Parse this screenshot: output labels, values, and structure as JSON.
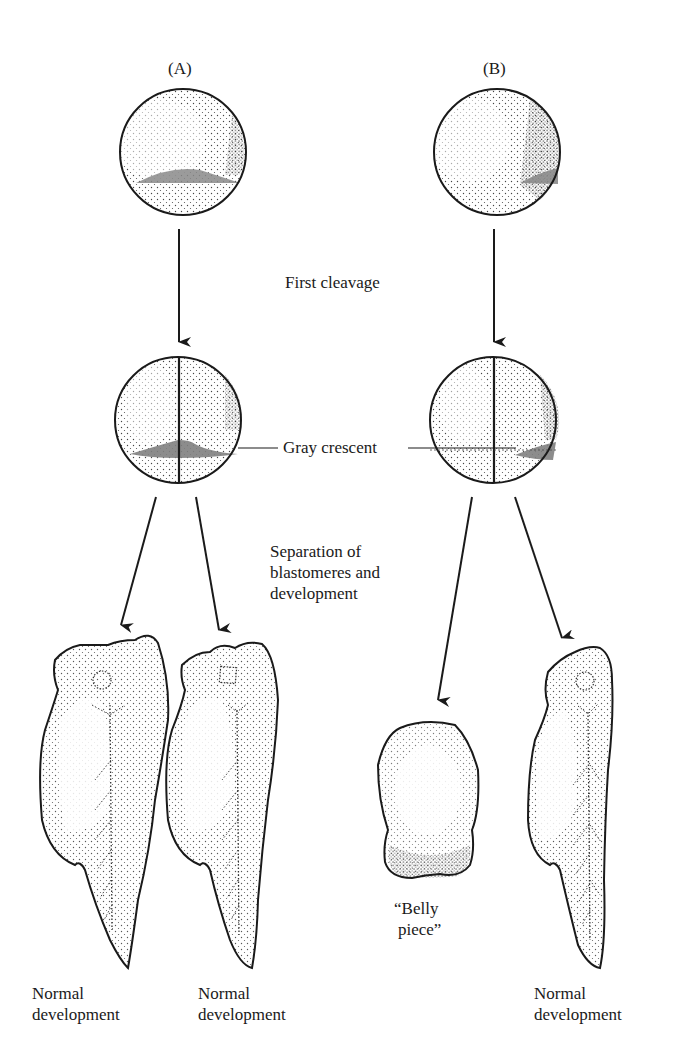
{
  "columns": {
    "a": {
      "label": "(A)"
    },
    "b": {
      "label": "(B)"
    }
  },
  "labels": {
    "first_cleavage": "First cleavage",
    "gray_crescent": "Gray crescent",
    "separation_line1": "Separation of",
    "separation_line2": "blastomeres and",
    "separation_line3": "development",
    "belly_piece_line1": "“Belly",
    "belly_piece_line2": "piece”"
  },
  "outcomes": [
    {
      "line1": "Normal",
      "line2": "development"
    },
    {
      "line1": "Normal",
      "line2": "development"
    },
    {
      "line1": "Normal",
      "line2": "development"
    }
  ],
  "colors": {
    "ink": "#1a1a1a",
    "stipple": "#333333",
    "crescent": "#8a8a8a",
    "background": "#ffffff"
  }
}
